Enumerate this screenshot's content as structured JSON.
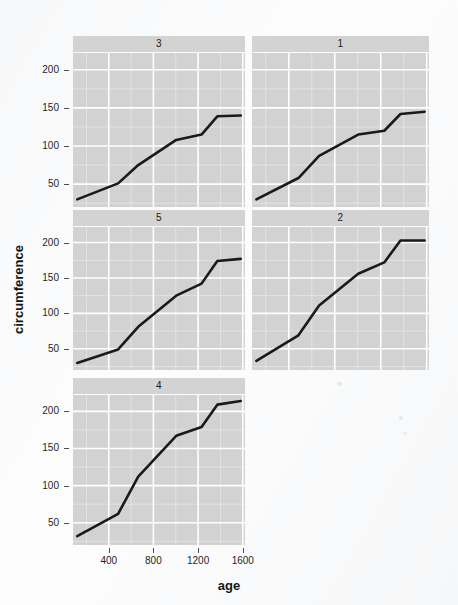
{
  "figure": {
    "width": 458,
    "height": 605,
    "background_color": "#fbfbfc",
    "panel_background_color": "#d2d2d2",
    "strip_background_color": "#d3d3d3",
    "gridline_color": "#ffffff",
    "line_color": "#1a1a1a"
  },
  "axis": {
    "x_title": "age",
    "y_title": "circumference",
    "x_ticks": [
      "400",
      "800",
      "1200",
      "1600"
    ],
    "y_ticks": [
      "50",
      "100",
      "150",
      "200"
    ]
  },
  "chart_data": {
    "type": "line",
    "title": "",
    "subtitle": "",
    "xlabel": "age",
    "ylabel": "circumference",
    "xlim": [
      80,
      1620
    ],
    "ylim": [
      20,
      222
    ],
    "x_ticks": [
      400,
      800,
      1200,
      1600
    ],
    "y_ticks": [
      50,
      100,
      150,
      200
    ],
    "grid": true,
    "legend": "none",
    "facet": {
      "variable": "Tree",
      "layout": "wrap",
      "ncol": 2,
      "order": [
        "3",
        "1",
        "5",
        "2",
        "4"
      ]
    },
    "x": [
      118,
      484,
      664,
      1004,
      1231,
      1372,
      1582
    ],
    "series": [
      {
        "name": "3",
        "facet_label": "3",
        "values": [
          30,
          51,
          75,
          108,
          115,
          139,
          140
        ]
      },
      {
        "name": "1",
        "facet_label": "1",
        "values": [
          30,
          58,
          87,
          115,
          120,
          142,
          145
        ]
      },
      {
        "name": "5",
        "facet_label": "5",
        "values": [
          30,
          49,
          81,
          125,
          142,
          174,
          177
        ]
      },
      {
        "name": "2",
        "facet_label": "2",
        "values": [
          33,
          69,
          111,
          156,
          172,
          203,
          203
        ]
      },
      {
        "name": "4",
        "facet_label": "4",
        "values": [
          32,
          62,
          112,
          167,
          179,
          209,
          214
        ]
      }
    ]
  },
  "panels": [
    {
      "label": "3",
      "left": 73,
      "top": 36,
      "width": 172,
      "height": 171,
      "show_x_axis": false
    },
    {
      "label": "1",
      "left": 252,
      "top": 36,
      "width": 177,
      "height": 171,
      "show_x_axis": false
    },
    {
      "label": "5",
      "left": 73,
      "top": 210,
      "width": 172,
      "height": 160,
      "show_x_axis": false
    },
    {
      "label": "2",
      "left": 252,
      "top": 210,
      "width": 177,
      "height": 160,
      "show_x_axis": false
    },
    {
      "label": "4",
      "left": 73,
      "top": 378,
      "width": 172,
      "height": 167,
      "show_x_axis": true
    }
  ]
}
